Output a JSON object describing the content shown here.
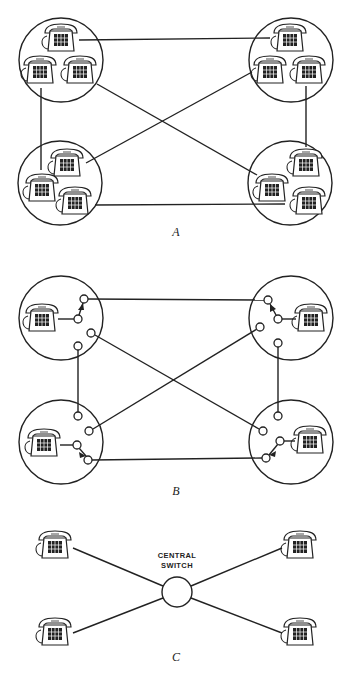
{
  "figure": {
    "panels": [
      {
        "id": "A",
        "label": "A",
        "description": "Fully connected exchanges: four clusters of three telephones, each cluster circled, wired directly to every other cluster",
        "clusters": [
          {
            "name": "top-left",
            "cx": 61,
            "cy": 60,
            "r": 42,
            "phones": [
              [
                61,
                38
              ],
              [
                40,
                70
              ],
              [
                80,
                70
              ]
            ]
          },
          {
            "name": "top-right",
            "cx": 291,
            "cy": 60,
            "r": 42,
            "phones": [
              [
                290,
                38
              ],
              [
                270,
                70
              ],
              [
                309,
                70
              ]
            ]
          },
          {
            "name": "bottom-left",
            "cx": 60,
            "cy": 183,
            "r": 42,
            "phones": [
              [
                67,
                163
              ],
              [
                42,
                188
              ],
              [
                75,
                201
              ]
            ]
          },
          {
            "name": "bottom-right",
            "cx": 290,
            "cy": 183,
            "r": 42,
            "phones": [
              [
                306,
                163
              ],
              [
                272,
                188
              ],
              [
                309,
                201
              ]
            ]
          }
        ],
        "links": [
          [
            79,
            40,
            270,
            38
          ],
          [
            41,
            88,
            41,
            170
          ],
          [
            97,
            84,
            257,
            175
          ],
          [
            252,
            72,
            86,
            163
          ],
          [
            306,
            86,
            306,
            147
          ],
          [
            95,
            205,
            285,
            204
          ]
        ]
      },
      {
        "id": "B",
        "label": "B",
        "description": "Each station with its own switch; every switch connected to every other switch",
        "clusters": [
          {
            "name": "top-left",
            "cx": 61,
            "cy": 318,
            "r": 42,
            "phone": [
              42,
              318
            ],
            "switch": [
              78,
              319
            ],
            "arrow_to": [
              84,
              299
            ],
            "nodes": [
              [
                84,
                299
              ],
              [
                91,
                333
              ],
              [
                78,
                346
              ]
            ]
          },
          {
            "name": "top-right",
            "cx": 291,
            "cy": 318,
            "r": 42,
            "phone": [
              311,
              318
            ],
            "switch": [
              278,
              319
            ],
            "arrow_to": [
              268,
              300
            ],
            "nodes": [
              [
                268,
                300
              ],
              [
                260,
                327
              ],
              [
                278,
                343
              ]
            ]
          },
          {
            "name": "bottom-left",
            "cx": 61,
            "cy": 442,
            "r": 42,
            "phone": [
              44,
              443
            ],
            "switch": [
              77,
              445
            ],
            "arrow_to": [
              88,
              460
            ],
            "nodes": [
              [
                78,
                416
              ],
              [
                89,
                431
              ],
              [
                88,
                460
              ]
            ]
          },
          {
            "name": "bottom-right",
            "cx": 291,
            "cy": 442,
            "r": 42,
            "phone": [
              310,
              440
            ],
            "switch": [
              280,
              441
            ],
            "arrow_to": [
              266,
              458
            ],
            "nodes": [
              [
                278,
                416
              ],
              [
                263,
                431
              ],
              [
                266,
                458
              ]
            ]
          }
        ],
        "links": [
          [
            88,
            299,
            264,
            300
          ],
          [
            95,
            335,
            259,
            429
          ],
          [
            257,
            329,
            93,
            429
          ],
          [
            78,
            350,
            78,
            412
          ],
          [
            278,
            347,
            278,
            412
          ],
          [
            92,
            460,
            262,
            458
          ]
        ]
      },
      {
        "id": "C",
        "label": "C",
        "description": "Star topology: four telephones connected through a central switch",
        "switch_label_line1": "CENTRAL",
        "switch_label_line2": "SWITCH",
        "switch": {
          "cx": 177,
          "cy": 592,
          "r": 15
        },
        "phones": [
          [
            55,
            545
          ],
          [
            55,
            632
          ],
          [
            300,
            545
          ],
          [
            300,
            632
          ]
        ],
        "links": [
          [
            73,
            548,
            163,
            586
          ],
          [
            73,
            633,
            163,
            598
          ],
          [
            282,
            548,
            191,
            586
          ],
          [
            282,
            633,
            191,
            598
          ]
        ]
      }
    ]
  }
}
